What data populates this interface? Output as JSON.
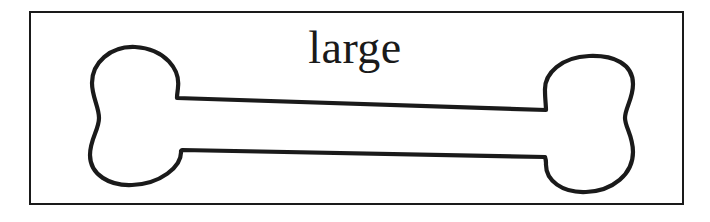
{
  "figure": {
    "caption": "large",
    "alt_name": "dog-bone-outline",
    "colors": {
      "background": "#ffffff",
      "stroke": "#1a1a1a",
      "fill": "#ffffff",
      "frame": "#1a1a1a"
    },
    "frame": {
      "x": 29,
      "y": 11,
      "width": 655,
      "height": 194,
      "border_width": 2
    },
    "bone": {
      "stroke_width": 4,
      "left_knob": {
        "center_x": 130,
        "top": 47,
        "bottom": 185,
        "left": 92,
        "right": 178
      },
      "right_knob": {
        "center_x": 589,
        "top": 56,
        "bottom": 192,
        "left": 545,
        "right": 633
      },
      "shaft": {
        "top_y_left": 98,
        "top_y_right": 110,
        "bottom_y_left": 150,
        "bottom_y_right": 157
      }
    }
  }
}
